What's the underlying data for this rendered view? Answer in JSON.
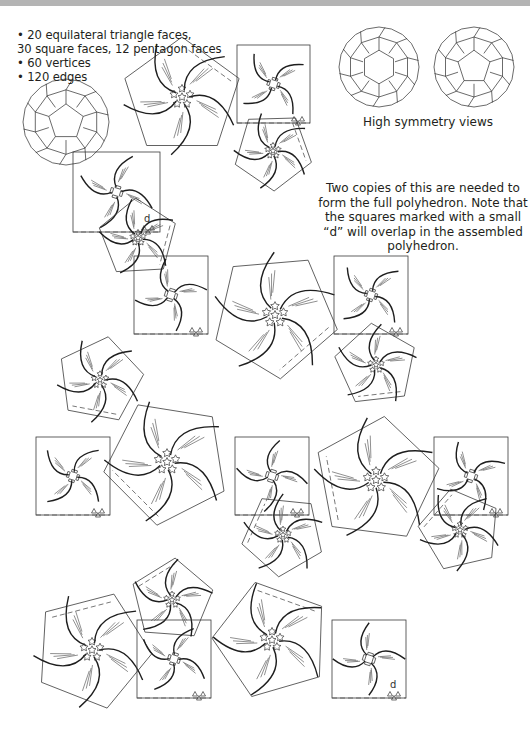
{
  "header": {
    "specs": [
      "• 20 equilateral triangle faces,",
      "30 square faces, 12 pentagon faces",
      "• 60 vertices",
      "• 120 edges"
    ],
    "views_caption": "High symmetry views",
    "note": "Two copies of this are needed to form the full polyhedron. Note that the squares marked with a small “d” will overlap in the assembled polyhedron.",
    "overlap_marker": "d"
  },
  "colors": {
    "line": "#231f20",
    "fold_line": "#555555",
    "top_band": "#b4b4b4",
    "background": "#ffffff"
  },
  "illustrations": [
    {
      "name": "shaded-perspective-view",
      "cx": 66,
      "cy": 122,
      "r": 43
    },
    {
      "name": "high-symmetry-view-1",
      "cx": 379,
      "cy": 67,
      "r": 40
    },
    {
      "name": "high-symmetry-view-2",
      "cx": 474,
      "cy": 67,
      "r": 40
    }
  ],
  "net": {
    "pieces": [
      {
        "type": "pentagon",
        "cx": 182,
        "cy": 97,
        "r": 60
      },
      {
        "type": "square",
        "x": 237,
        "y": 45,
        "w": 73,
        "h": 78
      },
      {
        "type": "pentagon",
        "cx": 273,
        "cy": 151,
        "r": 40
      },
      {
        "type": "square",
        "x": 73,
        "y": 152,
        "w": 87,
        "h": 80,
        "d": true
      },
      {
        "type": "pentagon",
        "cx": 138,
        "cy": 238,
        "r": 40
      },
      {
        "type": "square",
        "x": 134,
        "y": 256,
        "w": 74,
        "h": 78
      },
      {
        "type": "pentagon",
        "cx": 275,
        "cy": 315,
        "r": 64
      },
      {
        "type": "square",
        "x": 334,
        "y": 256,
        "w": 74,
        "h": 78
      },
      {
        "type": "pentagon",
        "cx": 376,
        "cy": 365,
        "r": 42
      },
      {
        "type": "pentagon",
        "cx": 100,
        "cy": 380,
        "r": 44
      },
      {
        "type": "square",
        "x": 36,
        "y": 437,
        "w": 74,
        "h": 78
      },
      {
        "type": "pentagon",
        "cx": 167,
        "cy": 462,
        "r": 64
      },
      {
        "type": "square",
        "x": 235,
        "y": 437,
        "w": 74,
        "h": 78
      },
      {
        "type": "pentagon",
        "cx": 376,
        "cy": 480,
        "r": 64
      },
      {
        "type": "square",
        "x": 434,
        "y": 437,
        "w": 74,
        "h": 78
      },
      {
        "type": "pentagon",
        "cx": 283,
        "cy": 535,
        "r": 42
      },
      {
        "type": "pentagon",
        "cx": 460,
        "cy": 530,
        "r": 42
      },
      {
        "type": "pentagon",
        "cx": 172,
        "cy": 600,
        "r": 42
      },
      {
        "type": "pentagon",
        "cx": 92,
        "cy": 650,
        "r": 60
      },
      {
        "type": "square",
        "x": 137,
        "y": 620,
        "w": 74,
        "h": 78
      },
      {
        "type": "pentagon",
        "cx": 272,
        "cy": 640,
        "r": 60
      },
      {
        "type": "square",
        "x": 332,
        "y": 620,
        "w": 74,
        "h": 78,
        "d": true
      }
    ]
  }
}
